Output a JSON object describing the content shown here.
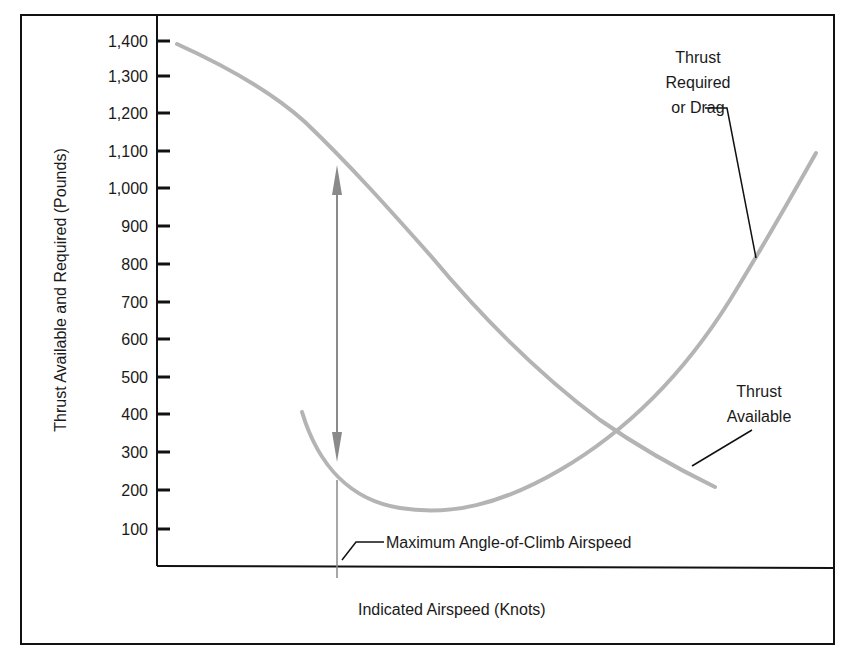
{
  "chart_data": {
    "type": "line",
    "title": "",
    "xlabel": "Indicated Airspeed (Knots)",
    "ylabel": "Thrust Available and Required (Pounds)",
    "ylim": [
      0,
      1450
    ],
    "yticks": [
      "1,400",
      "1,300",
      "1,200",
      "1,100",
      "1,000",
      "900",
      "800",
      "700",
      "600",
      "500",
      "400",
      "300",
      "200",
      "100"
    ],
    "xticks": [],
    "grid": false,
    "legend": "none (curves labeled directly)",
    "series": [
      {
        "name": "Thrust Available",
        "x_relative": [
          0.0,
          0.15,
          0.3,
          0.45,
          0.6,
          0.75,
          0.84
        ],
        "values": [
          1380,
          1280,
          1100,
          820,
          520,
          320,
          210
        ]
      },
      {
        "name": "Thrust Required or Drag",
        "x_relative": [
          0.22,
          0.3,
          0.43,
          0.55,
          0.68,
          0.84,
          0.97
        ],
        "values": [
          400,
          260,
          150,
          180,
          340,
          700,
          1100
        ]
      }
    ],
    "annotations": [
      {
        "text": "Thrust Required or Drag",
        "points_to": "Thrust Required or Drag curve"
      },
      {
        "text": "Thrust Available",
        "points_to": "Thrust Available curve"
      },
      {
        "text": "Maximum Angle-of-Climb Airspeed",
        "points_to": "vertical line at max excess thrust"
      },
      {
        "text": "double-headed arrow",
        "meaning": "maximum excess thrust, approx 1,080 to 260 pounds"
      }
    ]
  },
  "labels": {
    "y_axis_title": "Thrust Available and Required (Pounds)",
    "x_axis_title": "Indicated Airspeed (Knots)",
    "drag_label_line1": "Thrust",
    "drag_label_line2": "Required",
    "drag_label_line3": "or Drag",
    "avail_label_line1": "Thrust",
    "avail_label_line2": "Available",
    "max_climb_label": "Maximum Angle-of-Climb Airspeed"
  },
  "ticks": [
    {
      "label": "1,400",
      "y": 41
    },
    {
      "label": "1,300",
      "y": 76
    },
    {
      "label": "1,200",
      "y": 113
    },
    {
      "label": "1,100",
      "y": 151
    },
    {
      "label": "1,000",
      "y": 188
    },
    {
      "label": "900",
      "y": 226
    },
    {
      "label": "800",
      "y": 264
    },
    {
      "label": "700",
      "y": 302
    },
    {
      "label": "600",
      "y": 339
    },
    {
      "label": "500",
      "y": 377
    },
    {
      "label": "400",
      "y": 414
    },
    {
      "label": "300",
      "y": 452
    },
    {
      "label": "200",
      "y": 490
    },
    {
      "label": "100",
      "y": 529
    }
  ],
  "colors": {
    "curve": "#b4b4b4",
    "arrow": "#8a8a8a",
    "frame": "#111111"
  }
}
